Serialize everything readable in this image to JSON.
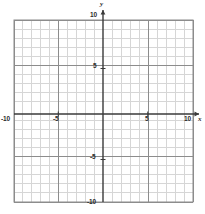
{
  "figure": {
    "kind": "cartesian-coordinate-grid",
    "background_color": "#ffffff"
  },
  "axis_names": {
    "x": "x",
    "y": "y"
  },
  "labels": {
    "y_top": "10",
    "y_upper_mid": "5",
    "y_lower_mid": "-5",
    "y_bottom": "-10",
    "x_left": "-10",
    "x_left_mid": "-5",
    "x_right_mid": "5",
    "x_right": "10"
  },
  "colors": {
    "minor_grid": "#d6d6d6",
    "major_grid": "#8c8c8c",
    "axis": "#3a3a3a",
    "border": "#8c8c8c",
    "text": "#2b2b2b"
  },
  "chart_data": {
    "type": "line",
    "title": "",
    "xlabel": "x",
    "ylabel": "y",
    "xlim": [
      -10,
      10
    ],
    "ylim": [
      -10,
      10
    ],
    "xticks": [
      -10,
      -5,
      5,
      10
    ],
    "yticks": [
      -10,
      -5,
      5,
      10
    ],
    "xtick_labels": [
      "-10",
      "-5",
      "5",
      "10"
    ],
    "ytick_labels": [
      "-10",
      "-5",
      "5",
      "10"
    ],
    "minor_tick_step": 1,
    "major_tick_step": 5,
    "grid": true,
    "legend": null,
    "series": [],
    "annotations": []
  }
}
